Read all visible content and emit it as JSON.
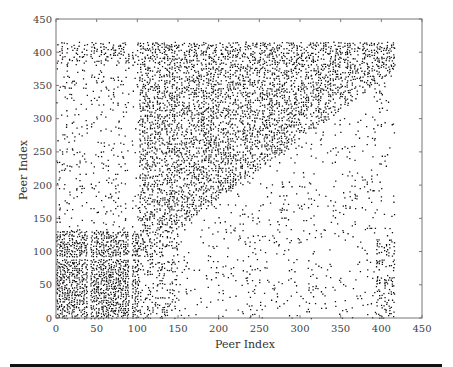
{
  "chart_data": {
    "type": "scatter",
    "title": "",
    "xlabel": "Peer Index",
    "ylabel": "Peer Index",
    "xlim": [
      0,
      450
    ],
    "ylim": [
      0,
      450
    ],
    "xticks": [
      0,
      50,
      100,
      150,
      200,
      250,
      300,
      350,
      400,
      450
    ],
    "yticks": [
      0,
      50,
      100,
      150,
      200,
      250,
      300,
      350,
      400,
      450
    ],
    "grid": false,
    "legend": null,
    "regions": [
      {
        "name": "dense-lower-left",
        "x": [
          0,
          100
        ],
        "y": [
          0,
          130
        ],
        "density": 0.85
      },
      {
        "name": "upper-triangle",
        "x": [
          0,
          415
        ],
        "y": [
          0,
          415
        ],
        "condition": "y > x*0.9",
        "density": 0.55
      },
      {
        "name": "lower-triangle-sparse",
        "x": [
          150,
          415
        ],
        "y": [
          0,
          100
        ],
        "density": 0.08
      },
      {
        "name": "top-band",
        "x": [
          0,
          100
        ],
        "y": [
          380,
          415
        ],
        "density": 0.35
      },
      {
        "name": "right-column",
        "x": [
          390,
          415
        ],
        "y": [
          0,
          120
        ],
        "density": 0.4
      }
    ],
    "gaps": {
      "x": [
        40,
        90
      ],
      "y": [
        90
      ]
    },
    "max_index": 415
  }
}
